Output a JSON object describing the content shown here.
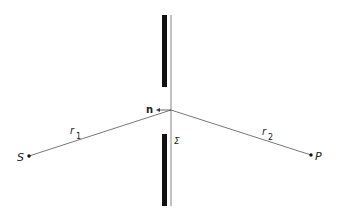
{
  "diagram": {
    "labels": {
      "source": "S",
      "point": "P",
      "r1": "r",
      "r1_sub": "1",
      "r2": "r",
      "r2_sub": "2",
      "normal": "n",
      "surface": "Σ"
    },
    "colors": {
      "screen": "#111111",
      "line": "#555555",
      "text": "#222222"
    },
    "geometry": {
      "aperture_point": [
        171,
        110
      ],
      "source_point": [
        29,
        156
      ],
      "observation_point": [
        311,
        155
      ],
      "upper_screen": {
        "x": 162,
        "y": 15,
        "w": 5,
        "h": 72
      },
      "lower_screen": {
        "x": 162,
        "y": 134,
        "w": 5,
        "h": 72
      },
      "surface_line": {
        "x": 171,
        "y1": 15,
        "y2": 206
      }
    }
  }
}
